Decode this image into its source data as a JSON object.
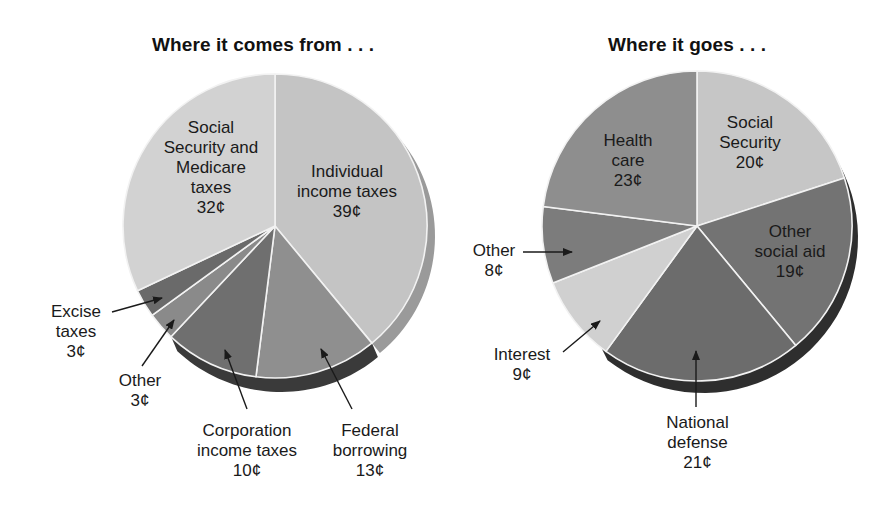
{
  "chart_data": [
    {
      "type": "pie",
      "title": "Where it comes from . . .",
      "unit": "¢",
      "start_angle_deg_clockwise_from_top": 0,
      "slices": [
        {
          "label": "Individual income taxes",
          "value": 39,
          "display": "39¢",
          "color": "#c4c4c4"
        },
        {
          "label": "Federal borrowing",
          "value": 13,
          "display": "13¢",
          "color": "#8f8f8f"
        },
        {
          "label": "Corporation income taxes",
          "value": 10,
          "display": "10¢",
          "color": "#6f6f6f"
        },
        {
          "label": "Other",
          "value": 3,
          "display": "3¢",
          "color": "#8a8a8a"
        },
        {
          "label": "Excise taxes",
          "value": 3,
          "display": "3¢",
          "color": "#6a6a6a"
        },
        {
          "label": "Social Security and Medicare taxes",
          "value": 32,
          "display": "32¢",
          "color": "#d2d2d2"
        }
      ]
    },
    {
      "type": "pie",
      "title": "Where it goes . . .",
      "unit": "¢",
      "start_angle_deg_clockwise_from_top": 0,
      "slices": [
        {
          "label": "Social Security",
          "value": 20,
          "display": "20¢",
          "color": "#c6c6c6"
        },
        {
          "label": "Other social aid",
          "value": 19,
          "display": "19¢",
          "color": "#737373"
        },
        {
          "label": "National defense",
          "value": 21,
          "display": "21¢",
          "color": "#6c6c6c"
        },
        {
          "label": "Interest",
          "value": 9,
          "display": "9¢",
          "color": "#d0d0d0"
        },
        {
          "label": "Other",
          "value": 8,
          "display": "8¢",
          "color": "#7c7c7c"
        },
        {
          "label": "Health care",
          "value": 23,
          "display": "23¢",
          "color": "#8e8e8e"
        }
      ]
    }
  ],
  "left": {
    "title": "Where it comes from . . .",
    "labels": {
      "ssm": [
        "Social",
        "Security and",
        "Medicare",
        "taxes",
        "32¢"
      ],
      "iit": [
        "Individual",
        "income taxes",
        "39¢"
      ],
      "excise": [
        "Excise",
        "taxes",
        "3¢"
      ],
      "other": [
        "Other",
        "3¢"
      ],
      "corp": [
        "Corporation",
        "income taxes",
        "10¢"
      ],
      "fed": [
        "Federal",
        "borrowing",
        "13¢"
      ]
    }
  },
  "right": {
    "title": "Where it goes . . .",
    "labels": {
      "health": [
        "Health",
        "care",
        "23¢"
      ],
      "ss": [
        "Social",
        "Security",
        "20¢"
      ],
      "osa": [
        "Other",
        "social aid",
        "19¢"
      ],
      "other": [
        "Other",
        "8¢"
      ],
      "interest": [
        "Interest",
        "9¢"
      ],
      "defense": [
        "National",
        "defense",
        "21¢"
      ]
    }
  },
  "colors": {
    "slice_border": "#f2f2f2",
    "rim_left_light": "#9a9a9a",
    "rim_left_dark": "#3a3a3a",
    "rim_right": "#2e2e2e",
    "arrow": "#1a1a1a"
  }
}
